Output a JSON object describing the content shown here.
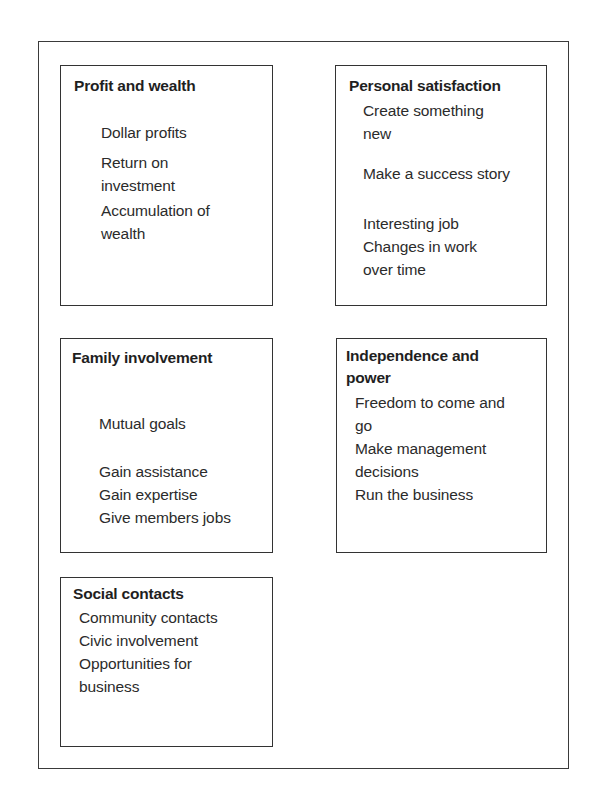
{
  "diagram": {
    "title": "",
    "boxes": [
      {
        "id": "profit",
        "title": "Profit and wealth",
        "items": [
          "Dollar profits",
          "Return on\ninvestment",
          "Accumulation of\nwealth"
        ]
      },
      {
        "id": "personal",
        "title": "Personal satisfaction",
        "items": [
          "Create something\nnew",
          "Make a success story",
          "Interesting job",
          "Changes in work\nover time"
        ]
      },
      {
        "id": "family",
        "title": "Family involvement",
        "items": [
          "Mutual goals",
          "Gain assistance",
          "Gain expertise",
          "Give members jobs"
        ]
      },
      {
        "id": "independence",
        "title": "Independence and\npower",
        "items": [
          "Freedom to come and\ngo",
          "Make management\ndecisions",
          "Run the business"
        ]
      },
      {
        "id": "social",
        "title": "Social contacts",
        "items": [
          "Community contacts",
          "Civic involvement",
          "Opportunities for\nbusiness"
        ]
      }
    ],
    "colors": {
      "border": "#333333",
      "text": "#2b2b2b",
      "background": "#ffffff"
    }
  }
}
